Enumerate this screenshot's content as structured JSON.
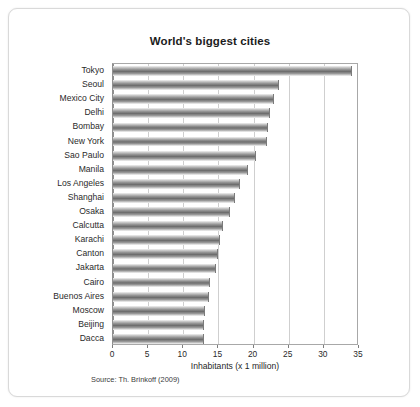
{
  "figure": {
    "title": "World's biggest cities",
    "source_note": "Source: Th. Brinkoff (2009)"
  },
  "chart_data": {
    "type": "bar",
    "orientation": "horizontal",
    "title": "World's biggest cities",
    "xlabel": "Inhabitants (x 1 million)",
    "ylabel": "",
    "xlim": [
      0,
      35
    ],
    "xticks": [
      0,
      5,
      10,
      15,
      20,
      25,
      30,
      35
    ],
    "grid": "vertical",
    "legend": "none",
    "source": "Source: Th. Brinkoff (2009)",
    "bar_color": "#7d7d7d",
    "categories": [
      "Tokyo",
      "Seoul",
      "Mexico City",
      "Delhi",
      "Bombay",
      "New York",
      "Sao Paulo",
      "Manila",
      "Los Angeles",
      "Shanghai",
      "Osaka",
      "Calcutta",
      "Karachi",
      "Canton",
      "Jakarta",
      "Cairo",
      "Buenos Aires",
      "Moscow",
      "Beijing",
      "Dacca"
    ],
    "values": [
      34.0,
      23.6,
      22.9,
      22.4,
      22.0,
      21.9,
      20.3,
      19.2,
      18.0,
      17.4,
      16.6,
      15.6,
      15.2,
      15.0,
      14.7,
      13.8,
      13.7,
      13.1,
      12.9,
      12.9
    ]
  }
}
